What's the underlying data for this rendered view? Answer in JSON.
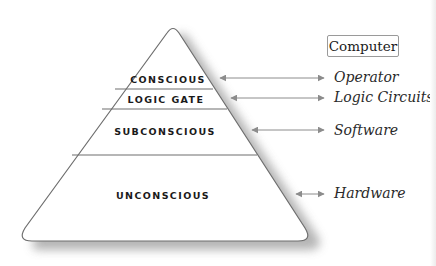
{
  "title_box": {
    "label": "Computer"
  },
  "pyramid": {
    "layers": [
      {
        "id": "conscious",
        "label": "CONSCIOUS"
      },
      {
        "id": "logic-gate",
        "label": "LOGIC GATE"
      },
      {
        "id": "subconscious",
        "label": "SUBCONSCIOUS"
      },
      {
        "id": "unconscious",
        "label": "UNCONSCIOUS"
      }
    ]
  },
  "mappings": [
    {
      "from": "CONSCIOUS",
      "to": "Operator"
    },
    {
      "from": "LOGIC GATE",
      "to": "Logic Circuits"
    },
    {
      "from": "SUBCONSCIOUS",
      "to": "Software"
    },
    {
      "from": "UNCONSCIOUS",
      "to": "Hardware"
    }
  ],
  "colors": {
    "outline": "#6e6e6e",
    "arrow": "#8c8c8c",
    "shadow": "#a8a8a8",
    "fill": "#ffffff"
  }
}
